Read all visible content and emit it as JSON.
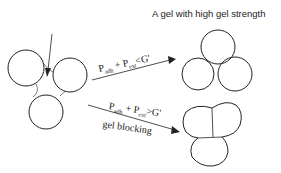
{
  "title": "A gel with high gel strength",
  "upper_path": {
    "condition": {
      "p1": "P",
      "s1": "adh",
      "op": "+",
      "p2": "P",
      "s2": "ext",
      "rel": "<",
      "g": "G'"
    }
  },
  "lower_path": {
    "condition": {
      "p1": "P",
      "s1": "adh",
      "op": "+",
      "p2": "P",
      "s2": "ext",
      "rel": ">",
      "g": "G'"
    },
    "label": "gel blocking"
  },
  "colors": {
    "line": "#222222",
    "background": "#ffffff"
  }
}
